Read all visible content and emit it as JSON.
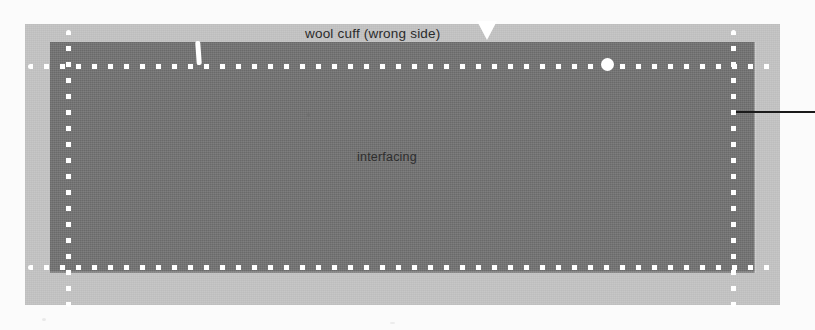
{
  "figure": {
    "width": 815,
    "height": 330,
    "background_color": "#fbfbfb"
  },
  "labels": {
    "wool_cuff": "wool cuff  (wrong side)",
    "interfacing": "interfacing"
  },
  "pieces": {
    "outer": {
      "name": "wool cuff",
      "color": "#c5c5c5"
    },
    "inner": {
      "name": "interfacing",
      "color": "#757575"
    }
  },
  "markings": {
    "stitch_line_color": "#ffffff",
    "notch_symbol": "V",
    "leader_line_color": "#1a1a1a",
    "stitch_lines": [
      {
        "name": "top-stitching-line",
        "orientation": "horizontal"
      },
      {
        "name": "bottom-stitching-line",
        "orientation": "horizontal"
      },
      {
        "name": "left-stitching-line",
        "orientation": "vertical"
      },
      {
        "name": "right-stitching-line",
        "orientation": "vertical"
      }
    ]
  }
}
